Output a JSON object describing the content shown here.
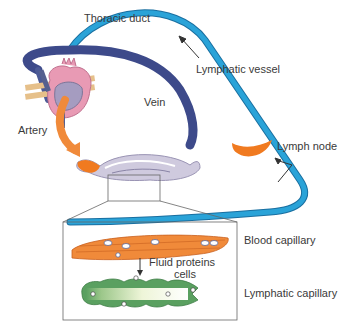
{
  "diagram": {
    "labels": {
      "thoracic_duct": "Thoracic duct",
      "lymphatic_vessel": "Lymphatic vessel",
      "vein": "Vein",
      "artery": "Artery",
      "lymph_node": "Lymph node",
      "blood_capillary": "Blood capillary",
      "fluid_proteins": "Fluid proteins",
      "cells": "cells",
      "lymphatic_capillary": "Lymphatic capillary"
    },
    "colors": {
      "lymph_blue": "#2aa3d8",
      "lymph_blue_dark": "#1a6fa0",
      "vein_navy": "#3d4a8a",
      "artery_orange": "#f08a3a",
      "artery_orange_dark": "#e0621e",
      "heart_pink": "#e89ab4",
      "heart_lavender": "#a59cc0",
      "capillary_lavender": "#cfcade",
      "node_orange": "#f07a20",
      "lymph_cap_green": "#5aa060",
      "lymph_cap_light": "#eef5d8",
      "text": "#3a3a3a",
      "line": "#555555"
    }
  }
}
